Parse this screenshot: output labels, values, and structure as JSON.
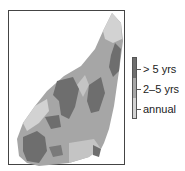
{
  "map": {
    "region_shape": "elongated-diagonal-landmass",
    "colors": {
      "annual": "#d2d2d2",
      "two_to_five": "#a6a6a6",
      "over_five": "#6e6e6e",
      "frame": "#444444"
    }
  },
  "legend": {
    "items": [
      {
        "label": "> 5 yrs",
        "color": "#6e6e6e"
      },
      {
        "label": "2–5 yrs",
        "color": "#a6a6a6"
      },
      {
        "label": "annual",
        "color": "#d2d2d2"
      }
    ]
  }
}
